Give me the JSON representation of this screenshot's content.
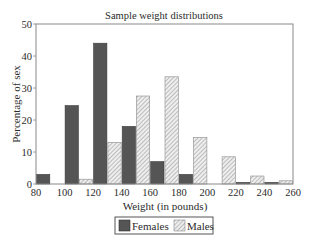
{
  "chart_data": {
    "type": "bar",
    "title": "Sample weight distributions",
    "xlabel": "Weight (in pounds)",
    "ylabel": "Percentage of sex",
    "xlim": [
      80,
      260
    ],
    "ylim": [
      0,
      50
    ],
    "x_ticks": [
      80,
      100,
      120,
      140,
      160,
      180,
      200,
      220,
      240,
      260
    ],
    "y_ticks": [
      0,
      10,
      20,
      30,
      40,
      50
    ],
    "bin_width": 20,
    "categories": [
      "80",
      "100",
      "120",
      "140",
      "160",
      "180",
      "200",
      "220",
      "240"
    ],
    "series": [
      {
        "name": "Females",
        "color": "#555555",
        "pattern": "solid",
        "values": [
          3,
          24.5,
          44,
          18,
          7,
          3,
          0,
          0.5,
          0.5
        ]
      },
      {
        "name": "Males",
        "color": "#d9d9d9",
        "pattern": "hatched",
        "values": [
          0,
          1.5,
          13,
          27.5,
          33.5,
          14.5,
          8.5,
          2.5,
          1
        ]
      }
    ],
    "legend_position": "bottom-center",
    "grid": false
  },
  "legend": {
    "females_label": "Females",
    "males_label": "Males"
  }
}
